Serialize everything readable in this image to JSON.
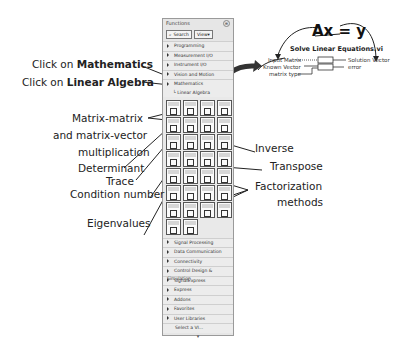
{
  "palette": {
    "title": "Functions",
    "toolbar": {
      "search_label": "Search",
      "view_label": "View▾"
    },
    "top_items": [
      {
        "label": "Programming"
      },
      {
        "label": "Measurement I/O"
      },
      {
        "label": "Instrument I/O"
      },
      {
        "label": "Vision and Motion"
      },
      {
        "label": "Mathematics"
      }
    ],
    "sub_item": "Linear Algebra",
    "bottom_items": [
      {
        "label": "Signal Processing"
      },
      {
        "label": "Data Communication"
      },
      {
        "label": "Connectivity"
      },
      {
        "label": "Control Design & Simulation"
      },
      {
        "label": "SignalExpress"
      },
      {
        "label": "Express"
      },
      {
        "label": "Addons"
      },
      {
        "label": "Favorites"
      },
      {
        "label": "User Libraries"
      }
    ],
    "select_vi": "Select a VI...",
    "icon_count": 30
  },
  "annotations": {
    "click_math_prefix": "Click on ",
    "click_math_bold": "Mathematics",
    "click_la_prefix": "Click on ",
    "click_la_bold": "Linear Algebra",
    "matrix_line1": "Matrix-matrix",
    "matrix_line2": "and matrix-vector",
    "matrix_line3": "multiplication",
    "determinant": "Determinant",
    "trace": "Trace",
    "condition": "Condition number",
    "eigen": "Eigenvalues",
    "inverse": "Inverse",
    "transpose": "Transpose",
    "factor1": "Factorization",
    "factor2": "methods"
  },
  "vi": {
    "equation": "Ax = y",
    "title": "Solve Linear Equations.vi",
    "inputs": [
      "Input Matrix",
      "Known Vector",
      "matrix type"
    ],
    "outputs": [
      "Solution Vector",
      "error"
    ]
  }
}
